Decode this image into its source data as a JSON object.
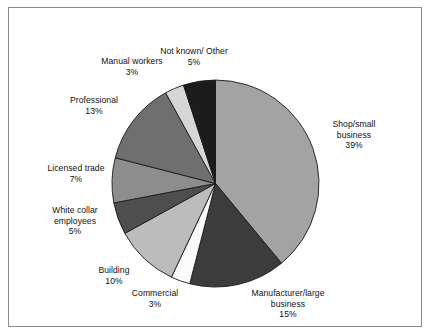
{
  "chart_data": {
    "type": "pie",
    "title": "",
    "subtitle": "",
    "xlabel": "",
    "ylabel": "",
    "legend_position": "none",
    "grid": false,
    "units": "%",
    "start_angle_deg": 0,
    "direction": "clockwise",
    "categories": [
      "Shop/small business",
      "Manufacturer/large business",
      "Commercial",
      "Building",
      "White collar employees",
      "Licensed trade",
      "Professional",
      "Manual workers",
      "Not known/ Other"
    ],
    "values": [
      39,
      15,
      3,
      10,
      5,
      7,
      13,
      3,
      5
    ],
    "value_labels": [
      "39%",
      "15%",
      "3%",
      "10%",
      "5%",
      "7%",
      "13%",
      "3%",
      "5%"
    ],
    "colors": [
      "#a3a3a3",
      "#3c3c3c",
      "#fbfbfb",
      "#bcbcbc",
      "#4e4e4e",
      "#8d8d8d",
      "#6f6f6f",
      "#d6d6d6",
      "#1c1c1c"
    ],
    "slice_outline_color": "#1b1b1b",
    "background_color": "#ffffff",
    "border_color": "#8c8c8c"
  },
  "labels": [
    {
      "name": "shop-small-business",
      "lines": [
        "Shop/small",
        "business",
        "39%"
      ]
    },
    {
      "name": "manufacturer-large-business",
      "lines": [
        "Manufacturer/large",
        "business",
        "15%"
      ]
    },
    {
      "name": "commercial",
      "lines": [
        "Commercial",
        "3%"
      ]
    },
    {
      "name": "building",
      "lines": [
        "Building",
        "10%"
      ]
    },
    {
      "name": "white-collar-employees",
      "lines": [
        "White collar",
        "employees",
        "5%"
      ]
    },
    {
      "name": "licensed-trade",
      "lines": [
        "Licensed trade",
        "7%"
      ]
    },
    {
      "name": "professional",
      "lines": [
        "Professional",
        "13%"
      ]
    },
    {
      "name": "manual-workers",
      "lines": [
        "Manual workers",
        "3%"
      ]
    },
    {
      "name": "not-known-other",
      "lines": [
        "Not known/ Other",
        "5%"
      ]
    }
  ]
}
